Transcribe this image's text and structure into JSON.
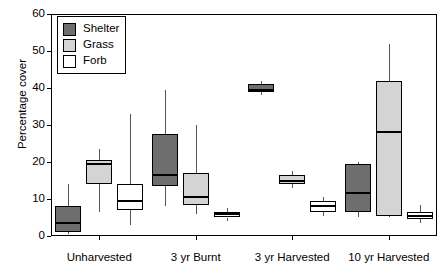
{
  "chart_data": {
    "type": "box",
    "title": "",
    "xlabel": "",
    "ylabel": "Percentage cover",
    "ylim": [
      0,
      60
    ],
    "yticks": [
      0,
      10,
      20,
      30,
      40,
      50,
      60
    ],
    "ytick_labels": [
      "0",
      "10",
      "20",
      "30",
      "40",
      "50",
      "60"
    ],
    "grid": false,
    "legend_position": "top-left",
    "categories": [
      "Unharvested",
      "3 yr Burnt",
      "3 yr Harvested",
      "10 yr Harvested"
    ],
    "series": [
      {
        "name": "Shelter",
        "color": "#6e6e6e",
        "boxes": [
          {
            "category": "Unharvested",
            "whisker_low": 0.5,
            "q1": 1.0,
            "median": 3.5,
            "q3": 8.0,
            "whisker_high": 14.0
          },
          {
            "category": "3 yr Burnt",
            "whisker_low": 8.0,
            "q1": 13.5,
            "median": 16.5,
            "q3": 27.5,
            "whisker_high": 39.5
          },
          {
            "category": "3 yr Harvested",
            "whisker_low": 38.0,
            "q1": 39.0,
            "median": 39.5,
            "q3": 41.0,
            "whisker_high": 42.0
          },
          {
            "category": "10 yr Harvested",
            "whisker_low": 5.0,
            "q1": 6.5,
            "median": 11.5,
            "q3": 19.5,
            "whisker_high": 20.0
          }
        ]
      },
      {
        "name": "Grass",
        "color": "#d4d4d4",
        "boxes": [
          {
            "category": "Unharvested",
            "whisker_low": 6.5,
            "q1": 14.0,
            "median": 19.5,
            "q3": 20.5,
            "whisker_high": 23.5
          },
          {
            "category": "3 yr Burnt",
            "whisker_low": 6.0,
            "q1": 8.5,
            "median": 10.5,
            "q3": 17.0,
            "whisker_high": 30.0
          },
          {
            "category": "3 yr Harvested",
            "whisker_low": 13.0,
            "q1": 14.0,
            "median": 15.0,
            "q3": 16.5,
            "whisker_high": 17.5
          },
          {
            "category": "10 yr Harvested",
            "whisker_low": 5.0,
            "q1": 5.5,
            "median": 28.0,
            "q3": 42.0,
            "whisker_high": 52.0
          }
        ]
      },
      {
        "name": "Forb",
        "color": "#ffffff",
        "boxes": [
          {
            "category": "Unharvested",
            "whisker_low": 3.0,
            "q1": 7.0,
            "median": 9.5,
            "q3": 14.0,
            "whisker_high": 33.0
          },
          {
            "category": "3 yr Burnt",
            "whisker_low": 4.0,
            "q1": 5.0,
            "median": 6.0,
            "q3": 6.5,
            "whisker_high": 7.5
          },
          {
            "category": "3 yr Harvested",
            "whisker_low": 5.5,
            "q1": 6.5,
            "median": 8.0,
            "q3": 9.5,
            "whisker_high": 10.5
          },
          {
            "category": "10 yr Harvested",
            "whisker_low": 3.5,
            "q1": 4.5,
            "median": 5.5,
            "q3": 6.5,
            "whisker_high": 8.5
          }
        ]
      }
    ]
  },
  "legend": {
    "items": [
      {
        "label": "Shelter",
        "color": "#6e6e6e"
      },
      {
        "label": "Grass",
        "color": "#d4d4d4"
      },
      {
        "label": "Forb",
        "color": "#ffffff"
      }
    ]
  },
  "axes": {
    "y_title": "Percentage cover"
  }
}
